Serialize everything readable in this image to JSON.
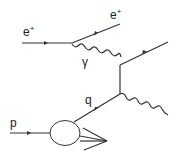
{
  "diagram": {
    "title": "",
    "type": "feynman",
    "labels": {
      "e_in": {
        "base": "e",
        "sup": "+"
      },
      "e_out": {
        "base": "e",
        "sup": "+"
      },
      "photon": "γ",
      "quark": "q",
      "proton": "p"
    },
    "colors": {
      "line": "#333333",
      "text": "#222222",
      "background": "#ffffff"
    }
  }
}
